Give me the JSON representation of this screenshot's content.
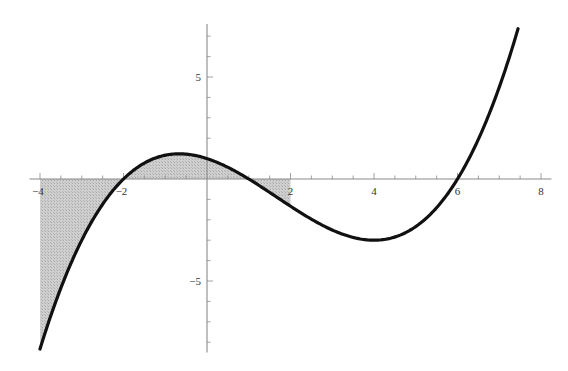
{
  "chart_data": {
    "type": "line",
    "title": "",
    "xlabel": "",
    "ylabel": "",
    "function": "f(x) = (x+2)(x-1)(x-6)/12",
    "x_range": [
      -4,
      7.45
    ],
    "xlim": [
      -4.25,
      8.25
    ],
    "ylim": [
      -8.5,
      7.6
    ],
    "grid": false,
    "legend": null,
    "x_ticks": [
      -4,
      -2,
      2,
      4,
      6,
      8
    ],
    "x_tick_labels": [
      "-4",
      "-2",
      "2",
      "4",
      "6",
      "8"
    ],
    "y_ticks": [
      -5,
      5
    ],
    "y_tick_labels": [
      "-5",
      "5"
    ],
    "x_minor_step": 0.5,
    "y_minor_step": 1,
    "series": [
      {
        "name": "f(x)",
        "color": "#111111",
        "x": [
          -4,
          -3.5,
          -3,
          -2.5,
          -2,
          -1.5,
          -1,
          -0.667,
          -0.5,
          0,
          0.5,
          1,
          1.5,
          2,
          2.5,
          3,
          3.5,
          4,
          4.5,
          5,
          5.5,
          6,
          6.5,
          7,
          7.45
        ],
        "y": [
          -8.33,
          -5.5,
          -3.33,
          -1.75,
          0,
          0.73,
          1.17,
          1.23,
          1.22,
          1.0,
          0.57,
          0,
          -0.66,
          -1.33,
          -1.97,
          -2.5,
          -2.86,
          -3.0,
          -2.84,
          -2.33,
          -1.41,
          0,
          1.97,
          4.5,
          7.37
        ]
      }
    ],
    "shaded_region": {
      "description": "Area between curve and x-axis",
      "x_from": -4,
      "x_to": 2,
      "color": "#c8c8c8"
    },
    "critical_points": {
      "roots": [
        -2,
        1,
        6
      ],
      "local_max": [
        -0.667,
        1.23
      ],
      "local_min": [
        4,
        -3
      ]
    }
  }
}
